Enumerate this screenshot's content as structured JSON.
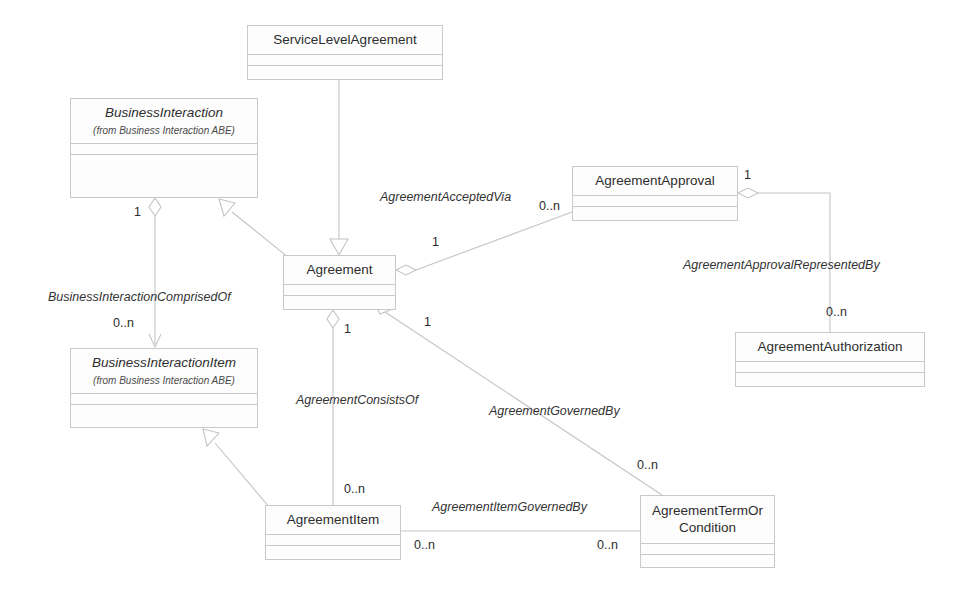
{
  "diagram": {
    "type": "uml-class-diagram",
    "background_color": "#ffffff",
    "line_color": "#c9c9c9",
    "text_color": "#2e2e2e",
    "classes": [
      {
        "id": "service-level-agreement",
        "name": "ServiceLevelAgreement",
        "package": "",
        "abstract": false,
        "x": 247,
        "y": 25,
        "w": 196,
        "h": 55
      },
      {
        "id": "business-interaction",
        "name": "BusinessInteraction",
        "package": "(from Business Interaction ABE)",
        "abstract": true,
        "x": 70,
        "y": 98,
        "w": 188,
        "h": 100
      },
      {
        "id": "agreement-approval",
        "name": "AgreementApproval",
        "package": "",
        "abstract": false,
        "x": 572,
        "y": 166,
        "w": 166,
        "h": 55
      },
      {
        "id": "agreement",
        "name": "Agreement",
        "package": "",
        "abstract": false,
        "x": 283,
        "y": 255,
        "w": 113,
        "h": 55
      },
      {
        "id": "agreement-authorization",
        "name": "AgreementAuthorization",
        "package": "",
        "abstract": false,
        "x": 735,
        "y": 332,
        "w": 190,
        "h": 55
      },
      {
        "id": "business-interaction-item",
        "name": "BusinessInteractionItem",
        "package": "(from Business Interaction ABE)",
        "abstract": true,
        "x": 70,
        "y": 348,
        "w": 188,
        "h": 80
      },
      {
        "id": "agreement-item",
        "name": "AgreementItem",
        "package": "",
        "abstract": false,
        "x": 265,
        "y": 505,
        "w": 136,
        "h": 55
      },
      {
        "id": "agreement-term-or-condition",
        "name": "AgreementTermOr\nCondition",
        "package": "",
        "abstract": false,
        "x": 640,
        "y": 495,
        "w": 135,
        "h": 73
      }
    ],
    "association_labels": [
      {
        "id": "agreement-accepted-via",
        "text": "AgreementAcceptedVia",
        "x": 380,
        "y": 190
      },
      {
        "id": "business-interaction-comprised-of",
        "text": "BusinessInteractionComprisedOf",
        "x": 48,
        "y": 290
      },
      {
        "id": "agreement-approval-represented-by",
        "text": "AgreementApprovalRepresentedBy",
        "x": 683,
        "y": 258
      },
      {
        "id": "agreement-consists-of",
        "text": "AgreementConsistsOf",
        "x": 296,
        "y": 393
      },
      {
        "id": "agreement-governed-by",
        "text": "AgreementGovernedBy",
        "x": 489,
        "y": 404
      },
      {
        "id": "agreement-item-governed-by",
        "text": "AgreementItemGovernedBy",
        "x": 432,
        "y": 500
      }
    ],
    "multiplicity_labels": [
      {
        "id": "mult-bi-to-bii-one",
        "text": "1",
        "x": 134,
        "y": 205
      },
      {
        "id": "mult-approval-0n",
        "text": "0..n",
        "x": 539,
        "y": 199
      },
      {
        "id": "mult-approval-side-one",
        "text": "1",
        "x": 744,
        "y": 168
      },
      {
        "id": "mult-agreement-approval-one",
        "text": "1",
        "x": 432,
        "y": 235
      },
      {
        "id": "mult-bii-0n",
        "text": "0..n",
        "x": 113,
        "y": 316
      },
      {
        "id": "mult-authorization-0n",
        "text": "0..n",
        "x": 826,
        "y": 305
      },
      {
        "id": "mult-agreement-item-one",
        "text": "1",
        "x": 344,
        "y": 322
      },
      {
        "id": "mult-agreement-term-one",
        "text": "1",
        "x": 424,
        "y": 315
      },
      {
        "id": "mult-termcond-0n",
        "text": "0..n",
        "x": 637,
        "y": 458
      },
      {
        "id": "mult-agreementitem-0n-top",
        "text": "0..n",
        "x": 344,
        "y": 482
      },
      {
        "id": "mult-agreementitem-0n",
        "text": "0..n",
        "x": 414,
        "y": 538
      },
      {
        "id": "mult-termcond-0n-bottom",
        "text": "0..n",
        "x": 597,
        "y": 538
      }
    ],
    "relationships": [
      {
        "id": "sla-generalizes-agreement",
        "from": "service-level-agreement",
        "to": "agreement",
        "type": "generalization"
      },
      {
        "id": "agreement-generalizes-bi",
        "from": "agreement",
        "to": "business-interaction",
        "type": "generalization"
      },
      {
        "id": "agreementitem-generalizes-bii",
        "from": "agreement-item",
        "to": "business-interaction-item",
        "type": "generalization"
      },
      {
        "id": "bi-comprised-of-bii",
        "from": "business-interaction",
        "to": "business-interaction-item",
        "type": "aggregation-directed"
      },
      {
        "id": "agreement-accepted-via-approval",
        "from": "agreement",
        "to": "agreement-approval",
        "type": "aggregation"
      },
      {
        "id": "approval-represented-by-auth",
        "from": "agreement-approval",
        "to": "agreement-authorization",
        "type": "aggregation"
      },
      {
        "id": "agreement-consists-of-item",
        "from": "agreement",
        "to": "agreement-item",
        "type": "aggregation"
      },
      {
        "id": "agreement-governed-by-term",
        "from": "agreement",
        "to": "agreement-term-or-condition",
        "type": "aggregation"
      },
      {
        "id": "item-governed-by-term",
        "from": "agreement-item",
        "to": "agreement-term-or-condition",
        "type": "association"
      }
    ]
  }
}
